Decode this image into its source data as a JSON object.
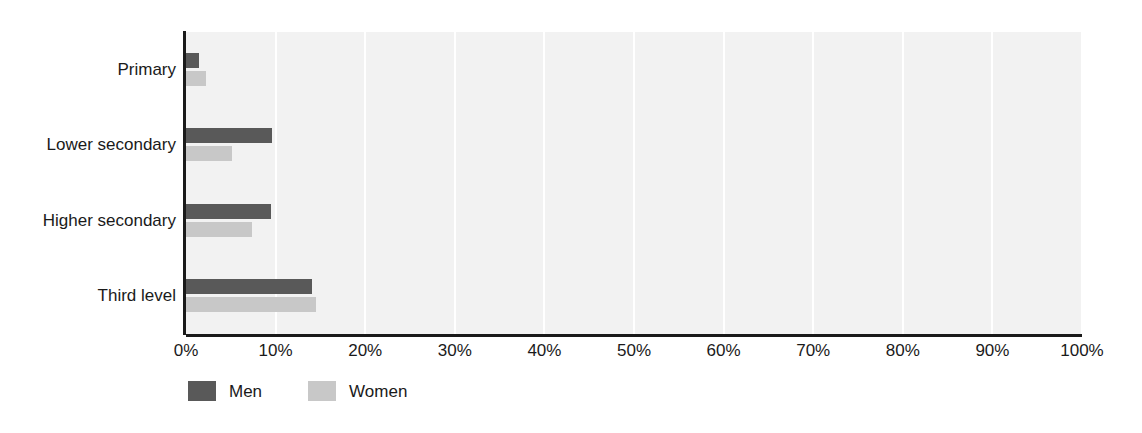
{
  "chart_data": {
    "type": "bar",
    "orientation": "horizontal",
    "title": "",
    "subtitle": "",
    "xlabel": "",
    "ylabel": "",
    "categories": [
      "Primary",
      "Lower secondary",
      "Higher secondary",
      "Third level"
    ],
    "series": [
      {
        "name": "Men",
        "color": "#595959",
        "values": [
          1.5,
          9.6,
          9.5,
          14.1
        ]
      },
      {
        "name": "Women",
        "color": "#c8c8c8",
        "values": [
          2.2,
          5.1,
          7.4,
          14.5
        ]
      }
    ],
    "xlim": [
      0,
      100
    ],
    "xticks": [
      0,
      10,
      20,
      30,
      40,
      50,
      60,
      70,
      80,
      90,
      100
    ],
    "xtick_labels": [
      "0%",
      "10%",
      "20%",
      "30%",
      "40%",
      "50%",
      "60%",
      "70%",
      "80%",
      "90%",
      "100%"
    ],
    "value_suffix": "%",
    "grid": {
      "vertical": true,
      "horizontal": false,
      "color": "#ffffff"
    },
    "plot_background": "#f2f2f2",
    "page_background": "#ffffff",
    "axis_color": "#1a1a1a",
    "legend": {
      "position": "bottom-left",
      "entries": [
        {
          "label": "Men",
          "color": "#595959"
        },
        {
          "label": "Women",
          "color": "#c8c8c8"
        }
      ]
    }
  }
}
